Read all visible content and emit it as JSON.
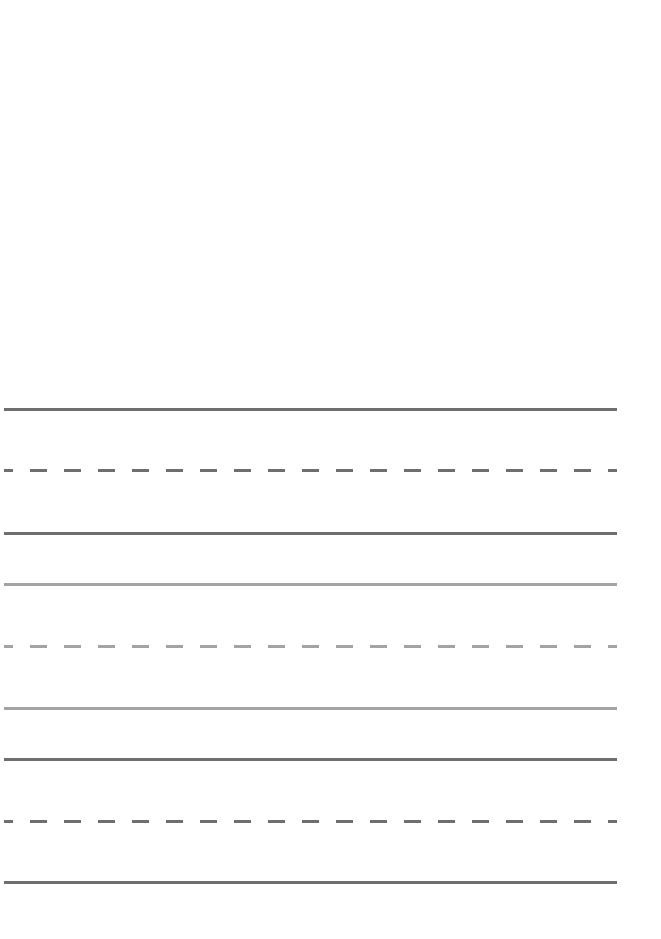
{
  "document": {
    "type": "handwriting-practice-sheet",
    "width": 661,
    "height": 939,
    "background": "#ffffff"
  },
  "colors": {
    "dark_line": "#6e6e6e",
    "light_line": "#a3a3a3"
  },
  "line_groups": [
    {
      "tone": "dark",
      "lines": [
        {
          "style": "solid",
          "y": 408
        },
        {
          "style": "dashed",
          "y": 469
        },
        {
          "style": "solid",
          "y": 532
        }
      ]
    },
    {
      "tone": "light",
      "lines": [
        {
          "style": "solid",
          "y": 583
        },
        {
          "style": "dashed",
          "y": 645
        },
        {
          "style": "solid",
          "y": 707
        }
      ]
    },
    {
      "tone": "dark",
      "lines": [
        {
          "style": "solid",
          "y": 758
        },
        {
          "style": "dashed",
          "y": 820
        },
        {
          "style": "solid",
          "y": 881
        }
      ]
    }
  ]
}
